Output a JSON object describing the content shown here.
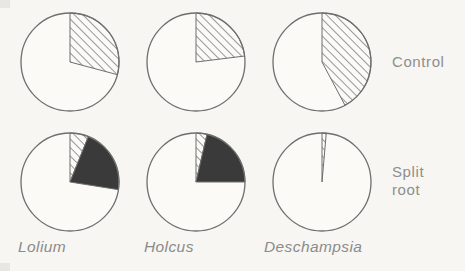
{
  "figure": {
    "background_color": "#f7f6f2",
    "ink_color": "#6e6e6e",
    "hatch_color": "#6e6e6e",
    "solid_color": "#3a3a3a",
    "empty_color": "#fbfaf7"
  },
  "row_labels": [
    {
      "id": "control",
      "text": "Control"
    },
    {
      "id": "split-root",
      "text": "Split\nroot"
    }
  ],
  "species_labels": [
    {
      "id": "lolium",
      "text": "Lolium"
    },
    {
      "id": "holcus",
      "text": "Holcus"
    },
    {
      "id": "deschampsia",
      "text": "Deschampsia"
    }
  ],
  "chart_data": {
    "type": "pie",
    "title": "",
    "subtitle": "",
    "xlabel": "",
    "ylabel": "",
    "legend_position": "right",
    "grid": false,
    "note": "2 x 3 grid of pie charts. Wedges start at 12 o'clock and run clockwise. Slice categories: hatched (diagonal lines), solid (black fill), empty (unshaded remainder). Values are percentages of the circle.",
    "categories": [
      "hatched",
      "solid",
      "empty"
    ],
    "row_names": [
      "Control",
      "Split root"
    ],
    "column_names": [
      "Lolium",
      "Holcus",
      "Deschampsia"
    ],
    "panels": [
      {
        "id": "lolium-control",
        "row": "Control",
        "column": "Lolium",
        "slices": [
          {
            "name": "hatched",
            "start_deg": 0,
            "end_deg": 105,
            "value": 29
          },
          {
            "name": "empty",
            "start_deg": 105,
            "end_deg": 360,
            "value": 71
          }
        ]
      },
      {
        "id": "holcus-control",
        "row": "Control",
        "column": "Holcus",
        "slices": [
          {
            "name": "hatched",
            "start_deg": 0,
            "end_deg": 83,
            "value": 23
          },
          {
            "name": "empty",
            "start_deg": 83,
            "end_deg": 360,
            "value": 77
          }
        ]
      },
      {
        "id": "deschampsia-control",
        "row": "Control",
        "column": "Deschampsia",
        "slices": [
          {
            "name": "hatched",
            "start_deg": 0,
            "end_deg": 152,
            "value": 42
          },
          {
            "name": "empty",
            "start_deg": 152,
            "end_deg": 360,
            "value": 58
          }
        ]
      },
      {
        "id": "lolium-split-root",
        "row": "Split root",
        "column": "Lolium",
        "slices": [
          {
            "name": "hatched",
            "start_deg": 0,
            "end_deg": 22,
            "value": 6
          },
          {
            "name": "solid",
            "start_deg": 22,
            "end_deg": 99,
            "value": 21
          },
          {
            "name": "empty",
            "start_deg": 99,
            "end_deg": 360,
            "value": 73
          }
        ]
      },
      {
        "id": "holcus-split-root",
        "row": "Split root",
        "column": "Holcus",
        "slices": [
          {
            "name": "hatched",
            "start_deg": 0,
            "end_deg": 13,
            "value": 4
          },
          {
            "name": "solid",
            "start_deg": 13,
            "end_deg": 90,
            "value": 21
          },
          {
            "name": "empty",
            "start_deg": 90,
            "end_deg": 360,
            "value": 75
          }
        ]
      },
      {
        "id": "deschampsia-split-root",
        "row": "Split root",
        "column": "Deschampsia",
        "slices": [
          {
            "name": "hatched",
            "start_deg": 0,
            "end_deg": 5,
            "value": 1
          },
          {
            "name": "empty",
            "start_deg": 5,
            "end_deg": 360,
            "value": 99
          }
        ]
      }
    ]
  }
}
